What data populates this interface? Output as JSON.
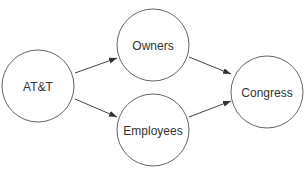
{
  "diagram": {
    "nodes": [
      {
        "id": "att",
        "label": "AT&T",
        "cx": 38,
        "cy": 86,
        "r": 36
      },
      {
        "id": "owners",
        "label": "Owners",
        "cx": 153,
        "cy": 45,
        "r": 36
      },
      {
        "id": "employees",
        "label": "Employees",
        "cx": 153,
        "cy": 130,
        "r": 36
      },
      {
        "id": "congress",
        "label": "Congress",
        "cx": 267,
        "cy": 92,
        "r": 36
      }
    ],
    "edges": [
      {
        "from": "att",
        "to": "owners"
      },
      {
        "from": "att",
        "to": "employees"
      },
      {
        "from": "owners",
        "to": "congress"
      },
      {
        "from": "employees",
        "to": "congress"
      }
    ],
    "colors": {
      "stroke": "#555555",
      "text": "#333333",
      "background": "#ffffff"
    }
  }
}
